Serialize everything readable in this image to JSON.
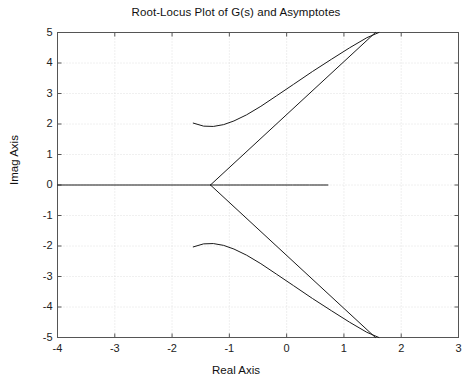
{
  "chart_data": {
    "type": "line",
    "title": "Root-Locus Plot of G(s) and Asymptotes",
    "xlabel": "Real Axis",
    "ylabel": "Imag Axis",
    "xlim": [
      -4,
      3
    ],
    "ylim": [
      -5,
      5
    ],
    "xticks": [
      -4,
      -3,
      -2,
      -1,
      0,
      1,
      2,
      3
    ],
    "yticks": [
      -5,
      -4,
      -3,
      -2,
      -1,
      0,
      1,
      2,
      3,
      4,
      5
    ],
    "xtick_labels": [
      "-4",
      "-3",
      "-2",
      "-1",
      "0",
      "1",
      "2",
      "3"
    ],
    "ytick_labels": [
      "-5",
      "-4",
      "-3",
      "-2",
      "-1",
      "0",
      "1",
      "2",
      "3",
      "4",
      "5"
    ],
    "grid": true,
    "grid_style": "dotted",
    "grid_color": "#d8d8d8",
    "axes_color": "#555555",
    "curve_color": "#1a1a1a",
    "legend": null,
    "series": [
      {
        "name": "real-axis-branch",
        "kind": "root-locus",
        "comment": "Locus segment along the real axis from the breakaway point to the right",
        "x": [
          -1.33,
          -1.1,
          -0.8,
          -0.5,
          -0.2,
          0.1,
          0.4,
          0.72
        ],
        "y": [
          0,
          0,
          0,
          0,
          0,
          0,
          0,
          0
        ]
      },
      {
        "name": "upper-complex-branch",
        "kind": "root-locus",
        "comment": "Branch departing the complex pole at -1.63+2.03j, curving right and upward off the top of the axes",
        "x": [
          -1.63,
          -1.45,
          -1.28,
          -1.1,
          -0.92,
          -0.7,
          -0.45,
          -0.18,
          0.12,
          0.45,
          0.78,
          1.1,
          1.4,
          1.61
        ],
        "y": [
          2.03,
          1.93,
          1.92,
          1.98,
          2.1,
          2.3,
          2.58,
          2.92,
          3.3,
          3.72,
          4.12,
          4.5,
          4.83,
          5.0
        ]
      },
      {
        "name": "lower-complex-branch",
        "kind": "root-locus",
        "comment": "Mirror branch departing the complex pole at -1.63-2.03j",
        "x": [
          -1.63,
          -1.45,
          -1.28,
          -1.1,
          -0.92,
          -0.7,
          -0.45,
          -0.18,
          0.12,
          0.45,
          0.78,
          1.1,
          1.4,
          1.61
        ],
        "y": [
          -2.03,
          -1.93,
          -1.92,
          -1.98,
          -2.1,
          -2.3,
          -2.58,
          -2.92,
          -3.3,
          -3.72,
          -4.12,
          -4.5,
          -4.83,
          -5.0
        ]
      },
      {
        "name": "asymptote-upper",
        "kind": "asymptote",
        "comment": "Straight asymptote from the centroid at +60 degrees",
        "angle_deg": 60,
        "centroid": [
          -1.33,
          0
        ],
        "x": [
          -1.33,
          1.55
        ],
        "y": [
          0,
          5.0
        ]
      },
      {
        "name": "asymptote-lower",
        "kind": "asymptote",
        "comment": "Straight asymptote from the centroid at -60 degrees",
        "angle_deg": -60,
        "centroid": [
          -1.33,
          0
        ],
        "x": [
          -1.33,
          1.55
        ],
        "y": [
          0,
          -5.0
        ]
      },
      {
        "name": "asymptote-real",
        "kind": "asymptote",
        "comment": "Asymptote along the negative real axis at 180 degrees, overlapping the real-axis locus",
        "angle_deg": 180,
        "centroid": [
          -1.33,
          0
        ],
        "x": [
          -1.33,
          -4.0
        ],
        "y": [
          0,
          0
        ]
      }
    ]
  }
}
